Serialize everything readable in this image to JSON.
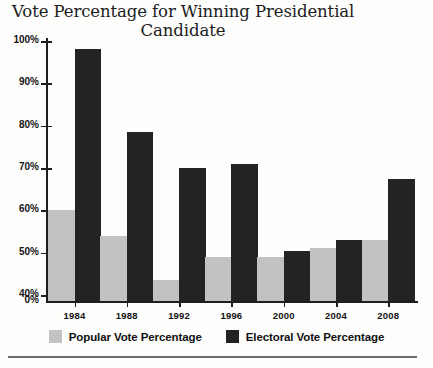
{
  "chart_data": {
    "type": "bar",
    "title": "Vote Percentage for Winning Presidential Candidate",
    "title_line1": "Vote Percentage for Winning Presidential",
    "title_line2": "Candidate",
    "xlabel": "",
    "ylabel": "",
    "categories": [
      "1984",
      "1988",
      "1992",
      "1996",
      "2000",
      "2004",
      "2008"
    ],
    "series": [
      {
        "name": "Popular Vote Percentage",
        "color": "#c2c2c2",
        "values": [
          60,
          54,
          43.5,
          49,
          49,
          51,
          53
        ]
      },
      {
        "name": "Electoral Vote Percentage",
        "color": "#232323",
        "values": [
          98,
          78.5,
          70,
          71,
          50.5,
          53,
          67.5
        ]
      }
    ],
    "ytick_labels": [
      "100%",
      "90%",
      "80%",
      "70%",
      "60%",
      "50%",
      "40%",
      "0%"
    ],
    "ytick_values": [
      100,
      90,
      80,
      70,
      60,
      50,
      40,
      0
    ],
    "ylim": [
      40,
      100
    ],
    "axis_broken": true,
    "grid": false,
    "legend_position": "bottom"
  },
  "legend": {
    "entries": [
      {
        "label": "Popular Vote Percentage",
        "swatch": "popular"
      },
      {
        "label": "Electoral Vote Percentage",
        "swatch": "electoral"
      }
    ]
  }
}
